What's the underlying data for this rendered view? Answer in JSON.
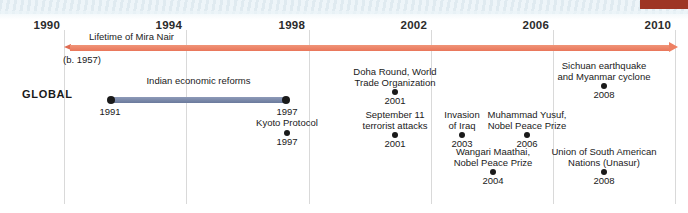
{
  "chart_data": {
    "type": "timeline",
    "title": "",
    "row_label": "GLOBAL",
    "axis": {
      "start_year": 1990,
      "end_year": 2010,
      "tick_years": [
        1990,
        1994,
        1998,
        2002,
        2006,
        2010
      ],
      "tick_labels": [
        "1990",
        "1994",
        "1998",
        "2002",
        "2006",
        "2010"
      ],
      "grid": true
    },
    "lifetime": {
      "label": "Lifetime of Mira Nair",
      "birth_note": "(b. 1957)",
      "color": "#ed8063",
      "extends_before_start": true,
      "extends_after_end": true
    },
    "span_events": [
      {
        "title": "Indian economic reforms",
        "start_year": 1991,
        "end_year": 1997,
        "start_label": "1991",
        "end_label": "1997",
        "color": "#7a88aa"
      }
    ],
    "point_events": [
      {
        "title": "Kyoto Protocol",
        "year": 1997,
        "year_label": "1997"
      },
      {
        "title": "Doha Round, World\nTrade Organization",
        "year": 2001,
        "year_label": "2001"
      },
      {
        "title": "September 11\nterrorist attacks",
        "year": 2001,
        "year_label": "2001"
      },
      {
        "title": "Invasion\nof Iraq",
        "year": 2003,
        "year_label": "2003"
      },
      {
        "title": "Wangari Maathai,\nNobel Peace Prize",
        "year": 2004,
        "year_label": "2004"
      },
      {
        "title": "Muhammad Yusuf,\nNobel Peace Prize",
        "year": 2006,
        "year_label": "2006"
      },
      {
        "title": "Sichuan earthquake\nand Myanmar cyclone",
        "year": 2008,
        "year_label": "2008"
      },
      {
        "title": "Union of South American\nNations (Unasur)",
        "year": 2008,
        "year_label": "2008"
      }
    ],
    "colors": {
      "lifetime_bar": "#ed8063",
      "span_bar": "#7a88aa",
      "gridline": "#d9d9d9",
      "text": "#1a1a1a",
      "corner_tab": "#9e3524",
      "top_band": "#e4eef3"
    }
  },
  "layout": {
    "ticks": [
      {
        "label": "1990",
        "x": 64
      },
      {
        "label": "1994",
        "x": 186
      },
      {
        "label": "1998",
        "x": 309
      },
      {
        "label": "2002",
        "x": 431
      },
      {
        "label": "2006",
        "x": 553
      },
      {
        "label": "2010",
        "x": 675
      }
    ],
    "span_events": [
      {
        "left": 110,
        "width": 177,
        "top": 97
      }
    ],
    "point_events": [
      {
        "left": 287,
        "top": 118
      },
      {
        "left": 395,
        "top": 67
      },
      {
        "left": 395,
        "top": 110
      },
      {
        "left": 462,
        "top": 110
      },
      {
        "left": 493,
        "top": 147
      },
      {
        "left": 527,
        "top": 110
      },
      {
        "left": 604,
        "top": 61
      },
      {
        "left": 604,
        "top": 147
      }
    ]
  }
}
